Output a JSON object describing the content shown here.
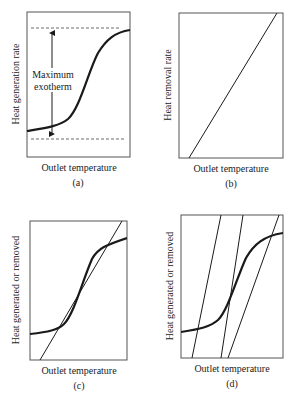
{
  "panels": [
    {
      "id": "a",
      "label": "(a)",
      "xlabel": "Outlet temperature",
      "ylabel": "Heat generation rate",
      "annotation_line1": "Maximum",
      "annotation_line2": "exotherm",
      "curve": "sigmoid heat generation curve",
      "guides": "dashed upper and lower asymptote lines with double-headed arrow"
    },
    {
      "id": "b",
      "label": "(b)",
      "xlabel": "Outlet temperature",
      "ylabel": "Heat removal rate",
      "curve": "straight rising heat removal line"
    },
    {
      "id": "c",
      "label": "(c)",
      "xlabel": "Outlet temperature",
      "ylabel": "Heat generated or removed",
      "curve": "sigmoid generation curve crossed by one removal line at three points"
    },
    {
      "id": "d",
      "label": "(d)",
      "xlabel": "Outlet temperature",
      "ylabel": "Heat generated or removed",
      "curve": "sigmoid generation curve with three parallel-ish removal lines"
    }
  ],
  "colors": {
    "line": "#1a1a1a",
    "frame": "#555555",
    "dashed": "#444444"
  }
}
